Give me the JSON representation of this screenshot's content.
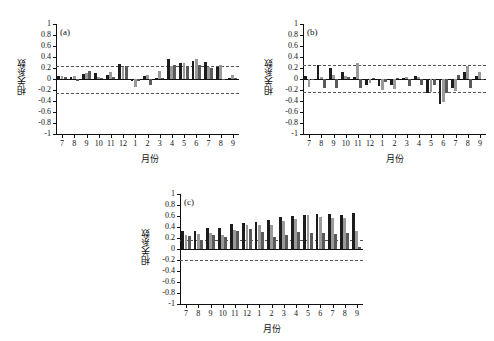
{
  "figure": {
    "background": "#ffffff",
    "bar_dark": "#1c1c1c",
    "bar_light": "#9a9a9a",
    "bar_mid": "#5a5a5a",
    "axis_color": "#111111",
    "sig_line_color": "#555555"
  },
  "chart_data": [
    {
      "type": "bar",
      "panel": "(a)",
      "title": "",
      "xlabel": "月份",
      "ylabel": "相关系数",
      "ylim": [
        -1,
        1
      ],
      "yticks": [
        1,
        0.8,
        0.6,
        0.4,
        0.2,
        0,
        -0.2,
        -0.4,
        -0.6,
        -0.8,
        -1
      ],
      "ytick_labels": [
        "1",
        "0.8",
        "0.6",
        "0.4",
        "0.2",
        "0",
        "-0.2",
        "-0.4",
        "-0.6",
        "-0.8",
        "-1"
      ],
      "categories": [
        "7",
        "8",
        "9",
        "10",
        "11",
        "12",
        "1",
        "2",
        "3",
        "4",
        "5",
        "6",
        "7",
        "8",
        "9"
      ],
      "grid": false,
      "legend": "none",
      "significance_lines": [
        0.24,
        -0.25
      ],
      "groups_per_category": 3,
      "values": [
        [
          0.05,
          0.05,
          0.04
        ],
        [
          0.04,
          0.05,
          -0.03
        ],
        [
          0.09,
          0.11,
          0.15
        ],
        [
          0.11,
          0.04,
          0.02
        ],
        [
          0.08,
          0.12,
          0.03
        ],
        [
          0.27,
          0.22,
          0.23
        ],
        [
          -0.04,
          -0.15,
          -0.03
        ],
        [
          0.06,
          0.08,
          -0.1
        ],
        [
          0.01,
          0.15,
          0.01
        ],
        [
          0.36,
          0.24,
          0.26
        ],
        [
          0.3,
          0.29,
          0.22
        ],
        [
          0.33,
          0.37,
          0.26
        ],
        [
          0.31,
          0.21,
          0.2
        ],
        [
          0.21,
          0.25,
          -0.02
        ],
        [
          0.02,
          0.07,
          0.01
        ]
      ]
    },
    {
      "type": "bar",
      "panel": "(b)",
      "title": "",
      "xlabel": "月份",
      "ylabel": "相关系数",
      "ylim": [
        -1,
        1
      ],
      "yticks": [
        1,
        0.8,
        0.6,
        0.4,
        0.2,
        0,
        -0.2,
        -0.4,
        -0.6,
        -0.8,
        -1
      ],
      "ytick_labels": [
        "1",
        "0.8",
        "0.6",
        "0.4",
        "0.2",
        "0",
        "-0.2",
        "-0.4",
        "-0.6",
        "-0.8",
        "-1"
      ],
      "categories": [
        "7",
        "8",
        "9",
        "10",
        "11",
        "12",
        "1",
        "2",
        "3",
        "4",
        "5",
        "6",
        "7",
        "8",
        "9"
      ],
      "grid": false,
      "legend": "none",
      "significance_lines": [
        0.25,
        -0.24
      ],
      "groups_per_category": 3,
      "values": [
        [
          0.06,
          -0.14,
          -0.02
        ],
        [
          0.26,
          0.04,
          -0.17
        ],
        [
          0.2,
          0.08,
          -0.16
        ],
        [
          0.13,
          0.05,
          0.03
        ],
        [
          0.04,
          0.29,
          -0.17
        ],
        [
          -0.11,
          -0.08,
          0.02
        ],
        [
          -0.13,
          -0.2,
          -0.05
        ],
        [
          -0.11,
          -0.18,
          0.02
        ],
        [
          0.02,
          0.03,
          -0.12
        ],
        [
          0.05,
          0.04,
          -0.11
        ],
        [
          -0.26,
          -0.24,
          -0.1
        ],
        [
          -0.46,
          -0.42,
          -0.26
        ],
        [
          -0.16,
          -0.22,
          0.08
        ],
        [
          0.12,
          0.24,
          -0.16
        ],
        [
          0.05,
          0.12,
          -0.02
        ]
      ]
    },
    {
      "type": "bar",
      "panel": "(c)",
      "title": "",
      "xlabel": "月份",
      "ylabel": "相关系数",
      "ylim": [
        -1,
        1
      ],
      "yticks": [
        1,
        0.8,
        0.6,
        0.4,
        0.2,
        0,
        -0.2,
        -0.4,
        -0.6,
        -0.8,
        -1
      ],
      "ytick_labels": [
        "1",
        "0.8",
        "0.6",
        "0.4",
        "0.2",
        "0",
        "-0.2",
        "-0.4",
        "-0.6",
        "-0.8",
        "-1"
      ],
      "categories": [
        "7",
        "8",
        "9",
        "10",
        "11",
        "12",
        "1",
        "2",
        "3",
        "4",
        "5",
        "6",
        "7",
        "8",
        "9"
      ],
      "grid": false,
      "legend": "none",
      "significance_lines": [
        0.17,
        -0.2
      ],
      "groups_per_category": 3,
      "values": [
        [
          0.33,
          0.25,
          0.23
        ],
        [
          0.32,
          0.27,
          0.17
        ],
        [
          0.39,
          0.29,
          0.25
        ],
        [
          0.38,
          0.25,
          0.21
        ],
        [
          0.45,
          0.35,
          0.33
        ],
        [
          0.48,
          0.43,
          0.36
        ],
        [
          0.5,
          0.43,
          0.31
        ],
        [
          0.52,
          0.44,
          0.21
        ],
        [
          0.58,
          0.51,
          0.26
        ],
        [
          0.6,
          0.55,
          0.31
        ],
        [
          0.62,
          0.62,
          0.29
        ],
        [
          0.64,
          0.58,
          0.29
        ],
        [
          0.63,
          0.57,
          0.27
        ],
        [
          0.62,
          0.57,
          0.29
        ],
        [
          0.65,
          0.33,
          0.04
        ]
      ]
    }
  ]
}
